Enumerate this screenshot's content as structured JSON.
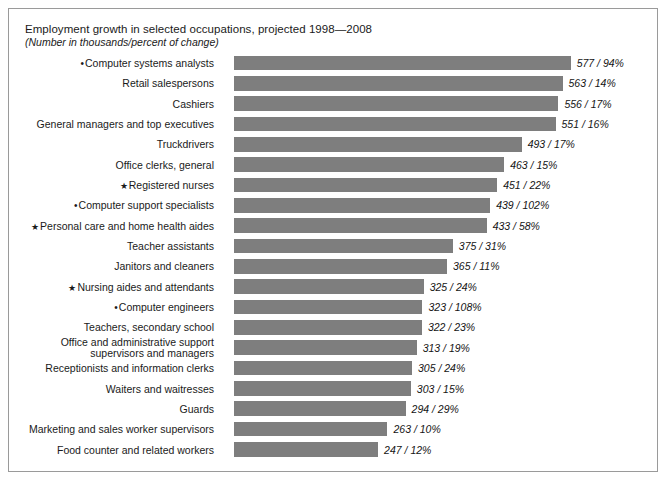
{
  "chart_data": {
    "type": "bar",
    "title": "Employment growth in selected occupations, projected 1998—2008",
    "subtitle": "(Number in thousands/percent of change)",
    "orientation": "horizontal",
    "xlabel": "",
    "ylabel": "",
    "xlim": [
      0,
      600
    ],
    "grid": false,
    "legend": "none",
    "value_label_format": "{number} / {percent}%",
    "bar_color": "#7e7e7e",
    "frame_color": "#9a9a9a",
    "categories": [
      "Computer systems analysts",
      "Retail salespersons",
      "Cashiers",
      "General managers and top executives",
      "Truckdrivers",
      "Office clerks, general",
      "Registered nurses",
      "Computer support specialists",
      "Personal care and home health aides",
      "Teacher assistants",
      "Janitors and cleaners",
      "Nursing aides and attendants",
      "Computer engineers",
      "Teachers, secondary school",
      "Office and administrative support supervisors and managers",
      "Receptionists and information clerks",
      "Waiters and waitresses",
      "Guards",
      "Marketing and sales worker supervisors",
      "Food counter and related workers"
    ],
    "values": [
      577,
      563,
      556,
      551,
      493,
      463,
      451,
      439,
      433,
      375,
      365,
      325,
      323,
      322,
      313,
      305,
      303,
      294,
      263,
      247
    ],
    "percent_change": [
      94,
      14,
      17,
      16,
      17,
      15,
      22,
      102,
      58,
      31,
      11,
      24,
      108,
      23,
      19,
      24,
      15,
      29,
      10,
      12
    ]
  },
  "rows": [
    {
      "marker": "dot",
      "label": "Computer systems analysts",
      "label_line2": "",
      "value": 577,
      "value_text": "577 / 94%"
    },
    {
      "marker": "none",
      "label": "Retail salespersons",
      "label_line2": "",
      "value": 563,
      "value_text": "563 / 14%"
    },
    {
      "marker": "none",
      "label": "Cashiers",
      "label_line2": "",
      "value": 556,
      "value_text": "556 / 17%"
    },
    {
      "marker": "none",
      "label": "General managers and top executives",
      "label_line2": "",
      "value": 551,
      "value_text": "551 / 16%"
    },
    {
      "marker": "none",
      "label": "Truckdrivers",
      "label_line2": "",
      "value": 493,
      "value_text": "493 / 17%"
    },
    {
      "marker": "none",
      "label": "Office clerks, general",
      "label_line2": "",
      "value": 463,
      "value_text": "463 / 15%"
    },
    {
      "marker": "star",
      "label": "Registered nurses",
      "label_line2": "",
      "value": 451,
      "value_text": "451 / 22%"
    },
    {
      "marker": "dot",
      "label": "Computer support specialists",
      "label_line2": "",
      "value": 439,
      "value_text": "439 / 102%"
    },
    {
      "marker": "star",
      "label": "Personal care and home health aides",
      "label_line2": "",
      "value": 433,
      "value_text": "433 / 58%"
    },
    {
      "marker": "none",
      "label": "Teacher assistants",
      "label_line2": "",
      "value": 375,
      "value_text": "375 / 31%"
    },
    {
      "marker": "none",
      "label": "Janitors and cleaners",
      "label_line2": "",
      "value": 365,
      "value_text": "365 / 11%"
    },
    {
      "marker": "star",
      "label": "Nursing aides and attendants",
      "label_line2": "",
      "value": 325,
      "value_text": "325 / 24%"
    },
    {
      "marker": "dot",
      "label": "Computer engineers",
      "label_line2": "",
      "value": 323,
      "value_text": "323 / 108%"
    },
    {
      "marker": "none",
      "label": "Teachers, secondary school",
      "label_line2": "",
      "value": 322,
      "value_text": "322 / 23%"
    },
    {
      "marker": "none",
      "label": "Office and administrative support",
      "label_line2": "supervisors and managers",
      "value": 313,
      "value_text": "313 / 19%"
    },
    {
      "marker": "none",
      "label": "Receptionists and information clerks",
      "label_line2": "",
      "value": 305,
      "value_text": "305 / 24%"
    },
    {
      "marker": "none",
      "label": "Waiters and waitresses",
      "label_line2": "",
      "value": 303,
      "value_text": "303 / 15%"
    },
    {
      "marker": "none",
      "label": "Guards",
      "label_line2": "",
      "value": 294,
      "value_text": "294 / 29%"
    },
    {
      "marker": "none",
      "label": "Marketing and sales worker supervisors",
      "label_line2": "",
      "value": 263,
      "value_text": "263 / 10%"
    },
    {
      "marker": "none",
      "label": "Food counter and related workers",
      "label_line2": "",
      "value": 247,
      "value_text": "247 / 12%"
    }
  ]
}
